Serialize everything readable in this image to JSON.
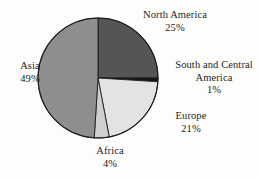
{
  "chart_data": {
    "type": "pie",
    "title": "",
    "subtitle": "",
    "xlabel": "",
    "ylabel": "",
    "legend_position": "none",
    "grid": false,
    "start_angle_deg": 0,
    "direction": "clockwise",
    "unit": "%",
    "categories": [
      "North America",
      "South and Central America",
      "Europe",
      "Africa",
      "Asia"
    ],
    "values": [
      25,
      1,
      21,
      4,
      49
    ],
    "colors": [
      "#555555",
      "#141414",
      "#e3e3e3",
      "#cfcfcf",
      "#8e8e8e"
    ],
    "slices": [
      {
        "name": "North America",
        "label_line1": "North America",
        "label_line2": "25%",
        "value": 25,
        "value_text": "25%",
        "color": "#555555",
        "start_pct": 0,
        "end_pct": 25
      },
      {
        "name": "South and Central America",
        "label_line1": "South and Central",
        "label_line2": "America",
        "label_line3": "1%",
        "value": 1,
        "value_text": "1%",
        "color": "#141414",
        "start_pct": 25,
        "end_pct": 26
      },
      {
        "name": "Europe",
        "label_line1": "Europe",
        "label_line2": "21%",
        "value": 21,
        "value_text": "21%",
        "color": "#e3e3e3",
        "start_pct": 26,
        "end_pct": 47
      },
      {
        "name": "Africa",
        "label_line1": "Africa",
        "label_line2": "4%",
        "value": 4,
        "value_text": "4%",
        "color": "#cfcfcf",
        "start_pct": 47,
        "end_pct": 51
      },
      {
        "name": "Asia",
        "label_line1": "Asia",
        "label_line2": "49%",
        "value": 49,
        "value_text": "49%",
        "color": "#8e8e8e",
        "start_pct": 51,
        "end_pct": 100
      }
    ],
    "geometry": {
      "center_x": 98,
      "center_y": 78,
      "radius": 60
    },
    "background_color": "#fdfdfc",
    "outline_color": "#1d1d1d"
  }
}
